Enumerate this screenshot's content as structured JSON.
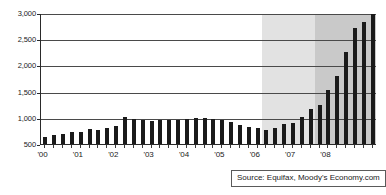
{
  "chart_data": {
    "type": "bar",
    "title": "",
    "subtitle": "",
    "xlabel": "",
    "ylabel": "",
    "ylim": [
      500,
      3000
    ],
    "grid": true,
    "legend": null,
    "source": "Source:  Equifax, Moody's Economy.com",
    "y_ticks": [
      "3,000",
      "2,500",
      "2,000",
      "1,500",
      "1,000",
      "500"
    ],
    "y_tick_values": [
      3000,
      2500,
      2000,
      1500,
      1000,
      500
    ],
    "x_tick_labels": [
      "'00",
      "'01",
      "'02",
      "'03",
      "'04",
      "'05",
      "'06",
      "'07",
      "'08"
    ],
    "categories": [
      "2000Q1",
      "2000Q2",
      "2000Q3",
      "2000Q4",
      "2001Q1",
      "2001Q2",
      "2001Q3",
      "2001Q4",
      "2002Q1",
      "2002Q2",
      "2002Q3",
      "2002Q4",
      "2003Q1",
      "2003Q2",
      "2003Q3",
      "2003Q4",
      "2004Q1",
      "2004Q2",
      "2004Q3",
      "2004Q4",
      "2005Q1",
      "2005Q2",
      "2005Q3",
      "2005Q4",
      "2006Q1",
      "2006Q2",
      "2006Q3",
      "2006Q4",
      "2007Q1",
      "2007Q2",
      "2007Q3",
      "2007Q4",
      "2008Q1",
      "2008Q2",
      "2008Q3",
      "2008Q4"
    ],
    "values": [
      640,
      680,
      700,
      720,
      725,
      780,
      775,
      805,
      845,
      1010,
      985,
      960,
      940,
      960,
      960,
      960,
      975,
      1000,
      990,
      975,
      950,
      925,
      865,
      825,
      815,
      775,
      805,
      875,
      900,
      1020,
      1160,
      1245,
      1535,
      1790,
      2265,
      2720
    ],
    "extra_values": [
      2825,
      3010
    ],
    "shaded_bands": [
      {
        "name": "light-band",
        "start_index": 25,
        "end_index": 31,
        "color": "#e2e2e2"
      },
      {
        "name": "dark-band",
        "start_index": 31,
        "end_index": 38,
        "color": "#c9c9c9"
      }
    ],
    "colors": {
      "bar": "#1a1a1a",
      "axis": "#2a2a2a",
      "gridline": "#4a4a4a",
      "band_light": "#e2e2e2",
      "band_dark": "#c9c9c9",
      "background": "#ffffff"
    }
  }
}
